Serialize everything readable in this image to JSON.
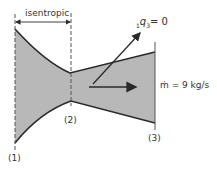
{
  "diagram": {
    "region_label": "isentropic",
    "heat_label_prefix": "1",
    "heat_label_q": "q",
    "heat_label_sub": "3",
    "heat_label_value": "= 0",
    "mass_flow_label": "ṁ = 9 kg/s",
    "stations": [
      "(1)",
      "(2)",
      "(3)"
    ],
    "colors": {
      "fill": "#b8b8b8",
      "stroke": "#2a2a2a",
      "text": "#333333"
    }
  }
}
